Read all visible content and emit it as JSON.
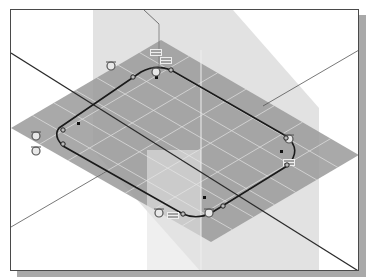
{
  "viewport": {
    "name": "sketch-viewport",
    "colors": {
      "background": "#ffffff",
      "frame": "#4a4a4a",
      "shadow": "#a9a9a9",
      "plane_horizontal": "#8c8c8c",
      "plane_vertical": "#cfcfcf",
      "grid_line": "#e6e6e6",
      "sketch_profile": "#1a1a1a",
      "axis_line": "#2a2a2a"
    }
  },
  "sketch": {
    "profile": "rounded-rectangle slot",
    "constraints": [
      {
        "type": "tangent",
        "label": "tangent-constraint"
      },
      {
        "type": "parallel",
        "label": "parallel-constraint"
      },
      {
        "type": "tangent",
        "label": "tangent-constraint"
      },
      {
        "type": "parallel",
        "label": "parallel-constraint"
      },
      {
        "type": "tangent",
        "label": "tangent-constraint"
      },
      {
        "type": "tangent",
        "label": "tangent-constraint"
      },
      {
        "type": "tangent",
        "label": "tangent-constraint"
      },
      {
        "type": "parallel",
        "label": "parallel-constraint"
      },
      {
        "type": "tangent",
        "label": "tangent-constraint"
      },
      {
        "type": "tangent",
        "label": "tangent-constraint"
      },
      {
        "type": "parallel",
        "label": "parallel-constraint"
      }
    ],
    "center_points": 4
  }
}
